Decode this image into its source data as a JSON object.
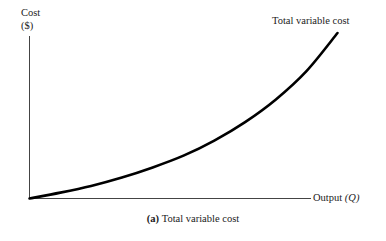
{
  "figure": {
    "caption_tag": "(a)",
    "caption_text": "Total variable cost",
    "background_color": "#ffffff",
    "ink_color": "#1a1a1a"
  },
  "chart_data": {
    "type": "line",
    "title": "",
    "subtitle": "",
    "xlabel": "Output (Q)",
    "xlabel_text": "Output",
    "xlabel_variable": "(Q)",
    "ylabel": "Cost ($)",
    "ylabel_text": "Cost",
    "ylabel_unit": "($)",
    "annotations": [
      {
        "name": "curve-label",
        "text": "Total variable cost",
        "x": 0.86,
        "y": 0.95
      }
    ],
    "legend": [],
    "legend_position": "none",
    "grid": false,
    "xlim": [
      0,
      1
    ],
    "ylim": [
      0,
      1
    ],
    "xticks": [],
    "yticks": [],
    "axis_color": "#444444",
    "curve_color": "#000000",
    "curve_width_px": 2.6,
    "series": [
      {
        "name": "Total variable cost",
        "description": "Convex increasing total variable cost curve rising from the origin",
        "x": [
          0.0,
          0.1,
          0.2,
          0.3,
          0.4,
          0.5,
          0.6,
          0.7,
          0.8,
          0.9,
          1.0
        ],
        "y": [
          0.0,
          0.035,
          0.075,
          0.125,
          0.185,
          0.255,
          0.345,
          0.455,
          0.59,
          0.76,
          0.985
        ]
      }
    ]
  }
}
